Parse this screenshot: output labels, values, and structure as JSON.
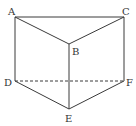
{
  "diagram": {
    "vertices": {
      "A": {
        "x": 15,
        "y": 17,
        "label": "A"
      },
      "B": {
        "x": 69,
        "y": 44,
        "label": "B"
      },
      "C": {
        "x": 124,
        "y": 17,
        "label": "C"
      },
      "D": {
        "x": 15,
        "y": 81,
        "label": "D"
      },
      "E": {
        "x": 69,
        "y": 109,
        "label": "E"
      },
      "F": {
        "x": 124,
        "y": 81,
        "label": "F"
      }
    },
    "solid_edges": [
      "AC",
      "AB",
      "BC",
      "AD",
      "BE",
      "CF",
      "DE",
      "EF"
    ],
    "dashed_edges": [
      "DF"
    ],
    "colors": {
      "line": "#3a3a3a",
      "text": "#333333",
      "background": "#ffffff"
    }
  }
}
